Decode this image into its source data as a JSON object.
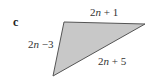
{
  "figure": {
    "part_label": "c",
    "shape": "triangle",
    "fill_color": "#c8c8c8",
    "stroke_color": "#555555",
    "vertices": [
      [
        64,
        22
      ],
      [
        145,
        24
      ],
      [
        53,
        76
      ]
    ],
    "sides": {
      "top": {
        "coef": "2",
        "var": "n",
        "rest": " + 1"
      },
      "left": {
        "coef": "2",
        "var": "n",
        "rest": " −3"
      },
      "bottom_right": {
        "coef": "2",
        "var": "n",
        "rest": " + 5"
      }
    }
  }
}
